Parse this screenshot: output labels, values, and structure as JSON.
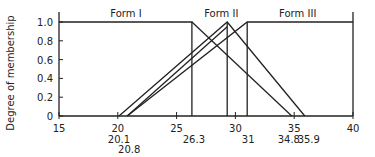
{
  "chart_data": {
    "type": "line",
    "title": "",
    "xlabel": "",
    "ylabel": "Degree of membership",
    "xlim": [
      15,
      40
    ],
    "ylim": [
      0,
      1.0
    ],
    "x_ticks": [
      15,
      20,
      25,
      30,
      35,
      40
    ],
    "y_ticks": [
      "0",
      "0.2",
      "0.4",
      "0.6",
      "0.8",
      "1.0"
    ],
    "annotated_x": [
      "20.1",
      "20.8",
      "26.3",
      "31",
      "34.8",
      "35.9"
    ],
    "grid": false,
    "series": [
      {
        "name": "Form I",
        "points": [
          [
            15,
            1
          ],
          [
            26.3,
            1
          ],
          [
            26.3,
            0
          ]
        ],
        "note": "vertical drop at 26.3"
      },
      {
        "name": "Form I (alt)",
        "points": [
          [
            26.3,
            1
          ],
          [
            34.8,
            0
          ]
        ]
      },
      {
        "name": "Form II (a)",
        "points": [
          [
            20.1,
            0
          ],
          [
            29.3,
            1
          ],
          [
            35.9,
            0
          ]
        ]
      },
      {
        "name": "Form II (b)",
        "points": [
          [
            20.8,
            0
          ],
          [
            29.3,
            0.95
          ]
        ]
      },
      {
        "name": "Form II vertical",
        "points": [
          [
            29.3,
            1
          ],
          [
            29.3,
            0
          ]
        ]
      },
      {
        "name": "Form III",
        "points": [
          [
            20.8,
            0
          ],
          [
            31,
            1
          ],
          [
            40,
            1
          ]
        ]
      },
      {
        "name": "Form III vertical",
        "points": [
          [
            31,
            1
          ],
          [
            31,
            0
          ]
        ]
      }
    ],
    "labels": [
      {
        "text": "Form I",
        "x": 20.7,
        "y": 1.03
      },
      {
        "text": "Form II",
        "x": 28.8,
        "y": 1.03
      },
      {
        "text": "Form III",
        "x": 35.3,
        "y": 1.03
      }
    ]
  }
}
